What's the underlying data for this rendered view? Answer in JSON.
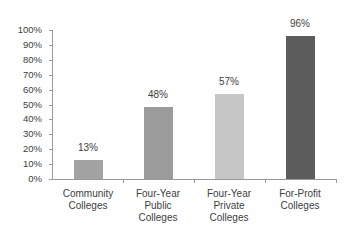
{
  "chart_data": {
    "type": "bar",
    "title": "",
    "xlabel": "",
    "ylabel": "",
    "categories": [
      "Community Colleges",
      "Four-Year Public Colleges",
      "Four-Year Private Colleges",
      "For-Profit Colleges"
    ],
    "category_lines": [
      [
        "Community",
        "Colleges"
      ],
      [
        "Four-Year",
        "Public",
        "Colleges"
      ],
      [
        "Four-Year",
        "Private",
        "Colleges"
      ],
      [
        "For-Profit",
        "Colleges"
      ]
    ],
    "values": [
      13,
      48,
      57,
      96
    ],
    "value_labels": [
      "13%",
      "48%",
      "57%",
      "96%"
    ],
    "bar_colors": [
      "#a3a3a3",
      "#9b9b9b",
      "#c6c6c6",
      "#5c5c5c"
    ],
    "ylim": [
      0,
      100
    ],
    "yticks": [
      "0%",
      "10%",
      "20%",
      "30%",
      "40%",
      "50%",
      "60%",
      "70%",
      "80%",
      "90%",
      "100%"
    ],
    "grid": false,
    "legend": null,
    "data_labels": true
  }
}
